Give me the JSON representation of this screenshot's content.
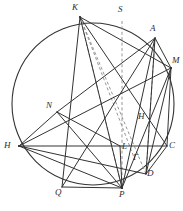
{
  "figure": {
    "type": "euclidean-geometry-diagram",
    "background_color": "#ffffff",
    "stroke_color": "#333333",
    "dashed_color": "#8a8a8a",
    "circle": {
      "name": "circumscribed-circle",
      "cx": 93,
      "cy": 104,
      "r": 81
    },
    "points": [
      {
        "id": "K",
        "label": "K",
        "x": 80,
        "y": 17,
        "label_x": 72,
        "label_y": 3
      },
      {
        "id": "S",
        "label": "S",
        "x": 122,
        "y": 21,
        "label_x": 118,
        "label_y": 5
      },
      {
        "id": "A",
        "label": "A",
        "x": 155,
        "y": 38,
        "label_x": 150,
        "label_y": 24
      },
      {
        "id": "M",
        "label": "M",
        "x": 171,
        "y": 68,
        "label_x": 172,
        "label_y": 56
      },
      {
        "id": "N",
        "label": "N",
        "x": 57,
        "y": 112,
        "label_x": 46,
        "label_y": 101
      },
      {
        "id": "H2",
        "label": "H",
        "x": 141,
        "y": 127,
        "label_x": 138,
        "label_y": 112
      },
      {
        "id": "H",
        "label": "H",
        "x": 19,
        "y": 146,
        "label_x": 6,
        "label_y": 141
      },
      {
        "id": "L",
        "label": "L",
        "x": 120,
        "y": 146,
        "label_x": 122,
        "label_y": 142
      },
      {
        "id": "C",
        "label": "C",
        "x": 167,
        "y": 146,
        "label_x": 169,
        "label_y": 141
      },
      {
        "id": "G",
        "label": "Γ",
        "x": 135,
        "y": 160,
        "label_x": 134,
        "label_y": 153
      },
      {
        "id": "D",
        "label": "D",
        "x": 146,
        "y": 174,
        "label_x": 147,
        "label_y": 170
      },
      {
        "id": "Q",
        "label": "Q",
        "x": 62,
        "y": 187,
        "label_x": 55,
        "label_y": 188
      },
      {
        "id": "P",
        "label": "P",
        "x": 122,
        "y": 188,
        "label_x": 120,
        "label_y": 190
      }
    ],
    "solid_segments": [
      {
        "name": "segment-K-P",
        "from": "K",
        "to": "P"
      },
      {
        "name": "segment-K-M",
        "from": "K",
        "to": "M"
      },
      {
        "name": "segment-K-C",
        "from": "K",
        "to": "C"
      },
      {
        "name": "segment-A-P",
        "from": "A",
        "to": "P"
      },
      {
        "name": "segment-A-M",
        "from": "A",
        "to": "M"
      },
      {
        "name": "segment-A-D",
        "from": "A",
        "to": "D"
      },
      {
        "name": "segment-A-N",
        "from": "A",
        "to": "N"
      },
      {
        "name": "segment-M-P",
        "from": "M",
        "to": "P"
      },
      {
        "name": "segment-M-D",
        "from": "M",
        "to": "D"
      },
      {
        "name": "segment-M-H2",
        "from": "M",
        "to": "H"
      },
      {
        "name": "segment-M-C",
        "from": "M",
        "to": "C"
      },
      {
        "name": "segment-N-H",
        "from": "N",
        "to": "H"
      },
      {
        "name": "segment-N-L",
        "from": "N",
        "to": "L"
      },
      {
        "name": "segment-N-P",
        "from": "N",
        "to": "P"
      },
      {
        "name": "segment-H-C",
        "from": "H",
        "to": "C"
      },
      {
        "name": "segment-H-P",
        "from": "H",
        "to": "P"
      },
      {
        "name": "segment-H-D",
        "from": "H",
        "to": "D"
      },
      {
        "name": "segment-Q-P",
        "from": "Q",
        "to": "P"
      },
      {
        "name": "segment-Q-A",
        "from": "Q",
        "to": "A"
      },
      {
        "name": "segment-L-P",
        "from": "L",
        "to": "P"
      },
      {
        "name": "segment-D-C",
        "from": "D",
        "to": "C"
      }
    ],
    "dashed_segments": [
      {
        "name": "dashed-K-P",
        "from": "K",
        "to": "P"
      },
      {
        "name": "dashed-K-G",
        "from": "K",
        "to": "G"
      },
      {
        "name": "dashed-K-D",
        "from": "K",
        "to": "D"
      },
      {
        "name": "dashed-S-P",
        "from": "S",
        "to": "P"
      },
      {
        "name": "dashed-A-D",
        "from": "A",
        "to": "D"
      }
    ],
    "chord_K_Q": {
      "name": "segment-K-Q",
      "from": "K",
      "to": "Q"
    }
  }
}
